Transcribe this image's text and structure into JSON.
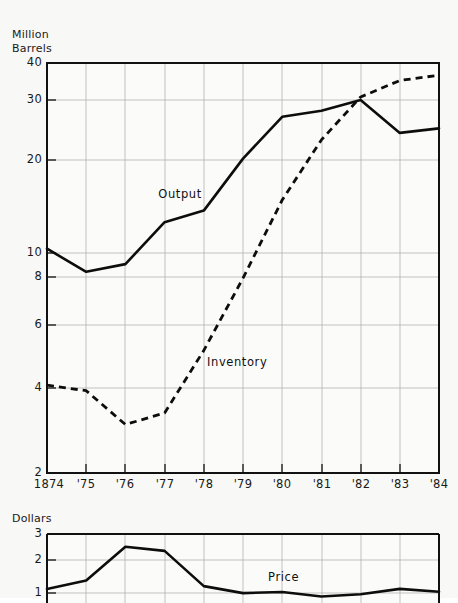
{
  "chart_data": [
    {
      "type": "line",
      "title": "",
      "ylabel": "Million Barrels",
      "xlabel": "",
      "yscale": "log",
      "ylim": [
        2,
        40
      ],
      "ytick_labels": [
        "40",
        "30",
        "20",
        "10",
        "8",
        "6",
        "4",
        "2"
      ],
      "ytick_values": [
        40,
        30,
        20,
        10,
        8,
        6,
        4,
        2
      ],
      "x": [
        1874,
        1875,
        1876,
        1877,
        1878,
        1879,
        1880,
        1881,
        1882,
        1883,
        1884
      ],
      "xtick_labels": [
        "1874",
        "'75",
        "'76",
        "'77",
        "'78",
        "'79",
        "'80",
        "'81",
        "'82",
        "'83",
        "'84"
      ],
      "grid": true,
      "legend_position": "inline-annotation",
      "series": [
        {
          "name": "Output",
          "style": "solid",
          "label_x": 1877.4,
          "label_y": 15.2,
          "values": [
            10.3,
            8.7,
            9.2,
            12.5,
            13.6,
            19.9,
            27.0,
            28.2,
            30.5,
            24.0,
            24.8
          ]
        },
        {
          "name": "Inventory",
          "style": "dashed",
          "label_x": 1879.0,
          "label_y": 4.55,
          "values": [
            3.8,
            3.65,
            2.85,
            3.1,
            4.9,
            8.3,
            14.7,
            22.8,
            31.2,
            35.2,
            36.6
          ]
        }
      ]
    },
    {
      "type": "line",
      "title": "",
      "ylabel": "Dollars",
      "xlabel": "",
      "yscale": "linear",
      "ylim": [
        0.55,
        3
      ],
      "ytick_labels": [
        "3",
        "2",
        "1"
      ],
      "ytick_values": [
        3,
        2,
        1
      ],
      "x": [
        1874,
        1875,
        1876,
        1877,
        1878,
        1879,
        1880,
        1881,
        1882,
        1883,
        1884
      ],
      "xtick_labels": [
        "1874",
        "'75",
        "'76",
        "'77",
        "'78",
        "'79",
        "'80",
        "'81",
        "'82",
        "'83",
        "'84"
      ],
      "grid": true,
      "legend_position": "inline-annotation",
      "series": [
        {
          "name": "Price",
          "style": "solid",
          "label_x": 1880.1,
          "label_y": 1.45,
          "values": [
            1.05,
            1.35,
            2.55,
            2.4,
            1.15,
            0.9,
            0.94,
            0.78,
            0.86,
            1.05,
            0.95
          ]
        }
      ]
    }
  ],
  "top_chart": {
    "unit_label": "Million\nBarrels",
    "y_ticks": [
      {
        "label": "40",
        "y": 63
      },
      {
        "label": "30",
        "y": 100
      },
      {
        "label": "20",
        "y": 160
      },
      {
        "label": "10",
        "y": 253
      },
      {
        "label": "8",
        "y": 277
      },
      {
        "label": "6",
        "y": 325
      },
      {
        "label": "4",
        "y": 388
      },
      {
        "label": "2",
        "y": 473
      }
    ],
    "x_ticks": [
      {
        "label": "1874",
        "x": 47
      },
      {
        "label": "'75",
        "x": 86
      },
      {
        "label": "'76",
        "x": 125
      },
      {
        "label": "'77",
        "x": 165
      },
      {
        "label": "'78",
        "x": 204
      },
      {
        "label": "'79",
        "x": 243
      },
      {
        "label": "'80",
        "x": 282
      },
      {
        "label": "'81",
        "x": 322
      },
      {
        "label": "'82",
        "x": 361
      },
      {
        "label": "'83",
        "x": 400
      },
      {
        "label": "'84",
        "x": 439
      }
    ],
    "output_label": "Output",
    "inventory_label": "Inventory",
    "output_path": "M47,251 L86,281 L125,272 L165,230 L204,222 L243,178 L282,117 L322,110 L361,96 L400,131 L439,125",
    "inventory_path": "M47,391 L86,396 L125,424 L165,415 L204,366 L243,291 L282,218 L322,152 L361,96 L400,76 L439,70"
  },
  "bottom_chart": {
    "unit_label": "Dollars",
    "y_ticks": [
      {
        "label": "3",
        "y": 534
      },
      {
        "label": "2",
        "y": 560
      },
      {
        "label": "1",
        "y": 593
      }
    ],
    "price_label": "Price",
    "price_path": "M47,592 L86,584 L125,553 L165,557 L204,589 L243,596 L282,595 L322,599 L361,598 L400,592 L439,595"
  }
}
